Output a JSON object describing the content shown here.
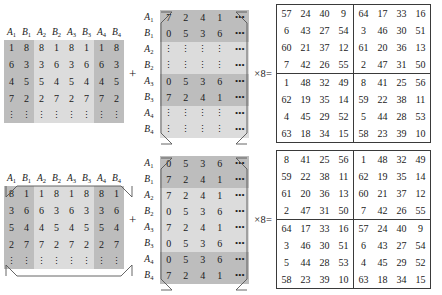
{
  "figure": {
    "operator_plus": "+",
    "operator_times_equals": "×8=",
    "ellipsis_h": "•••",
    "ellipsis_v": "⋮"
  },
  "labels": {
    "A": "A",
    "B": "B",
    "col_headers": [
      "A1",
      "B1",
      "A2",
      "B2",
      "A3",
      "B3",
      "A4",
      "B4"
    ],
    "col_headers_base": [
      "A",
      "B",
      "A",
      "B",
      "A",
      "B",
      "A",
      "B"
    ],
    "col_headers_sub": [
      "1",
      "1",
      "2",
      "2",
      "3",
      "3",
      "4",
      "4"
    ],
    "row_headers_base": [
      "A",
      "B",
      "A",
      "B",
      "A",
      "B",
      "A",
      "B"
    ],
    "row_headers_sub": [
      "1",
      "1",
      "2",
      "2",
      "3",
      "3",
      "4",
      "4"
    ]
  },
  "colors": {
    "shade_light": "#dcdcdc",
    "shade_dark": "#bdbdbd",
    "background": "#ffffff",
    "ink": "#1a1a1a",
    "rule": "#3a3a3a"
  },
  "top": {
    "matrix_a": {
      "name": "top-left-operand-matrix",
      "columns": [
        "A1",
        "B1",
        "A2",
        "B2",
        "A3",
        "B3",
        "A4",
        "B4"
      ],
      "rows": [
        [
          "1",
          "8",
          "8",
          "1",
          "8",
          "1",
          "1",
          "8"
        ],
        [
          "6",
          "3",
          "3",
          "6",
          "3",
          "6",
          "6",
          "3"
        ],
        [
          "4",
          "5",
          "5",
          "4",
          "5",
          "4",
          "4",
          "5"
        ],
        [
          "7",
          "2",
          "2",
          "7",
          "2",
          "7",
          "7",
          "2"
        ]
      ],
      "tail_row": [
        "⋮",
        "⋮",
        "⋮",
        "⋮",
        "⋮",
        "⋮",
        "⋮",
        "⋮"
      ],
      "dark_columns": [
        0,
        1,
        6,
        7
      ]
    },
    "matrix_b": {
      "name": "top-middle-operand-matrix",
      "row_labels": [
        "A1",
        "B1",
        "A2",
        "B2",
        "A3",
        "B3",
        "A4",
        "B4"
      ],
      "rows": [
        [
          "7",
          "2",
          "4",
          "1",
          "•••"
        ],
        [
          "0",
          "5",
          "3",
          "6",
          "•••"
        ],
        [
          "⋮",
          "⋮",
          "⋮",
          "⋮",
          "•••"
        ],
        [
          "⋮",
          "⋮",
          "⋮",
          "⋮",
          "•••"
        ],
        [
          "0",
          "5",
          "3",
          "6",
          "•••"
        ],
        [
          "7",
          "2",
          "4",
          "1",
          "•••"
        ],
        [
          "⋮",
          "⋮",
          "⋮",
          "⋮",
          "•••"
        ],
        [
          "⋮",
          "⋮",
          "⋮",
          "⋮",
          "•••"
        ]
      ],
      "dark_rows": [
        0,
        1,
        4,
        5
      ]
    },
    "result": {
      "name": "top-result-matrix",
      "rows": [
        [
          "57",
          "24",
          "40",
          "9",
          "64",
          "17",
          "33",
          "16"
        ],
        [
          "6",
          "43",
          "27",
          "54",
          "3",
          "46",
          "30",
          "51"
        ],
        [
          "60",
          "21",
          "37",
          "12",
          "61",
          "20",
          "36",
          "13"
        ],
        [
          "7",
          "42",
          "26",
          "55",
          "2",
          "47",
          "31",
          "50"
        ],
        [
          "1",
          "48",
          "32",
          "49",
          "8",
          "41",
          "25",
          "56"
        ],
        [
          "62",
          "19",
          "35",
          "14",
          "59",
          "22",
          "38",
          "11"
        ],
        [
          "4",
          "45",
          "29",
          "52",
          "5",
          "44",
          "28",
          "53"
        ],
        [
          "63",
          "18",
          "34",
          "15",
          "58",
          "23",
          "39",
          "10"
        ]
      ]
    }
  },
  "bottom": {
    "matrix_a": {
      "name": "bottom-left-operand-matrix",
      "columns": [
        "A1",
        "B1",
        "A2",
        "B2",
        "A3",
        "B3",
        "A4",
        "B4"
      ],
      "rows": [
        [
          "8",
          "1",
          "1",
          "8",
          "1",
          "8",
          "8",
          "1"
        ],
        [
          "3",
          "6",
          "6",
          "3",
          "6",
          "3",
          "3",
          "6"
        ],
        [
          "5",
          "4",
          "4",
          "5",
          "4",
          "5",
          "5",
          "4"
        ],
        [
          "2",
          "7",
          "7",
          "2",
          "7",
          "2",
          "2",
          "7"
        ]
      ],
      "tail_row": [
        "⋮",
        "⋮",
        "⋮",
        "⋮",
        "⋮",
        "⋮",
        "⋮",
        "⋮"
      ],
      "dark_columns": [
        0,
        1,
        6,
        7
      ]
    },
    "matrix_b": {
      "name": "bottom-middle-operand-matrix",
      "row_labels": [
        "A1",
        "B1",
        "A2",
        "B2",
        "A3",
        "B3",
        "A4",
        "B4"
      ],
      "rows": [
        [
          "0",
          "5",
          "3",
          "6",
          "•••"
        ],
        [
          "7",
          "2",
          "4",
          "1",
          "•••"
        ],
        [
          "7",
          "2",
          "4",
          "1",
          "•••"
        ],
        [
          "0",
          "5",
          "3",
          "6",
          "•••"
        ],
        [
          "7",
          "2",
          "4",
          "1",
          "•••"
        ],
        [
          "0",
          "5",
          "3",
          "6",
          "•••"
        ],
        [
          "0",
          "5",
          "3",
          "6",
          "•••"
        ],
        [
          "7",
          "2",
          "4",
          "1",
          "•••"
        ]
      ],
      "dark_rows": [
        0,
        1,
        6,
        7
      ]
    },
    "result": {
      "name": "bottom-result-matrix",
      "rows": [
        [
          "8",
          "41",
          "25",
          "56",
          "1",
          "48",
          "32",
          "49"
        ],
        [
          "59",
          "22",
          "38",
          "11",
          "62",
          "19",
          "35",
          "14"
        ],
        [
          "61",
          "20",
          "36",
          "13",
          "60",
          "21",
          "37",
          "12"
        ],
        [
          "2",
          "47",
          "31",
          "50",
          "7",
          "42",
          "26",
          "55"
        ],
        [
          "64",
          "17",
          "33",
          "16",
          "57",
          "24",
          "40",
          "9"
        ],
        [
          "3",
          "46",
          "30",
          "51",
          "6",
          "43",
          "27",
          "54"
        ],
        [
          "5",
          "44",
          "28",
          "53",
          "4",
          "45",
          "29",
          "52"
        ],
        [
          "58",
          "23",
          "39",
          "10",
          "63",
          "18",
          "34",
          "15"
        ]
      ]
    }
  }
}
